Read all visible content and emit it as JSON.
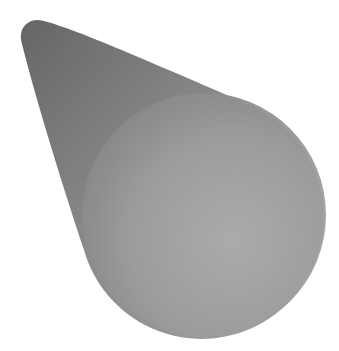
{
  "image": {
    "description": "Grayscale 3D cone shape viewed from an angle: a rounded tip at upper-left tapering out to a large circular base at lower-right",
    "background_color": "#ffffff",
    "shape": {
      "type": "cone",
      "tip": {
        "x": 34,
        "y": 30,
        "radius": 14
      },
      "base": {
        "cx": 204,
        "cy": 215,
        "r": 122
      },
      "colors": {
        "tip_dark": "#6e6e6e",
        "body_mid": "#9a9a9a",
        "base_light": "#b4b4b4",
        "base_shade": "#8c8c8c"
      }
    }
  }
}
